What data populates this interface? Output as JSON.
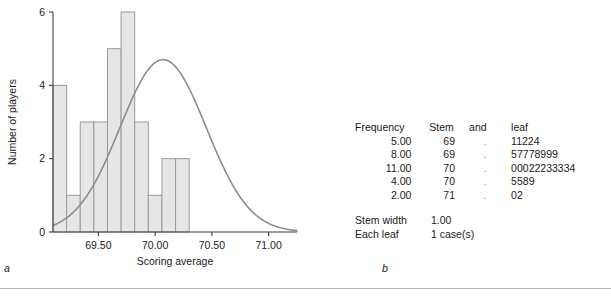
{
  "chart_data": {
    "type": "bar",
    "title": "",
    "xlabel": "Scoring average",
    "ylabel": "Number of players",
    "categories": [
      "69.15",
      "69.30",
      "69.45",
      "69.60",
      "69.75",
      "69.90",
      "70.05",
      "70.20",
      "70.35",
      "70.50"
    ],
    "bin_edges": [
      69.1,
      69.22,
      69.34,
      69.46,
      69.58,
      69.7,
      69.82,
      69.94,
      70.06,
      70.18,
      70.3
    ],
    "values": [
      4,
      1,
      3,
      3,
      5,
      6,
      3,
      1,
      2,
      2
    ],
    "xlim": [
      69.1,
      71.25
    ],
    "ylim": [
      0,
      6
    ],
    "xticks": [
      "69.50",
      "70.00",
      "70.50",
      "71.00"
    ],
    "xtick_values": [
      69.5,
      70.0,
      70.5,
      71.0
    ],
    "yticks": [
      "0",
      "2",
      "4",
      "6"
    ],
    "ytick_values": [
      0,
      2,
      4,
      6
    ],
    "grid": false,
    "overlay": {
      "name": "normal-curve",
      "mean": 70.07,
      "sd": 0.38,
      "peak": 4.7
    },
    "colors": {
      "bar_fill": "#e6e6e6",
      "bar_stroke": "#9a9a9a",
      "curve": "#8d8d8d",
      "axis": "#3d3d3d"
    }
  },
  "panel_a": {
    "letter": "a"
  },
  "panel_b": {
    "letter": "b",
    "headers": {
      "frequency": "Frequency",
      "stem": "Stem",
      "and": "and",
      "leaf": "leaf"
    },
    "rows": [
      {
        "frequency": "5.00",
        "stem": "69",
        "dot": ".",
        "leaf": "11224"
      },
      {
        "frequency": "8.00",
        "stem": "69",
        "dot": ".",
        "leaf": "57778999"
      },
      {
        "frequency": "11.00",
        "stem": "70",
        "dot": ".",
        "leaf": "00022233334"
      },
      {
        "frequency": "4.00",
        "stem": "70",
        "dot": ".",
        "leaf": "5589"
      },
      {
        "frequency": "2.00",
        "stem": "71",
        "dot": ".",
        "leaf": "02"
      }
    ],
    "footer": [
      {
        "label": "Stem width",
        "value": "1.00"
      },
      {
        "label": "Each leaf",
        "value": "1 case(s)"
      }
    ]
  }
}
